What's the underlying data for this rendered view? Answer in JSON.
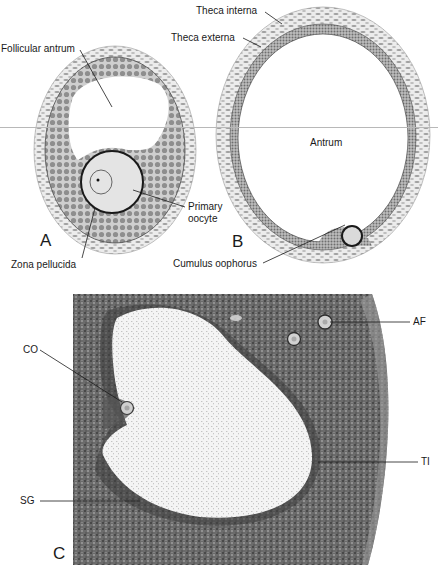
{
  "figure": {
    "panels": [
      {
        "id": "A",
        "letter": "A",
        "type": "illustration",
        "labels": {
          "follicular_antrum": "Follicular antrum",
          "primary_oocyte_line1": "Primary",
          "primary_oocyte_line2": "oocyte",
          "zona_pellucida": "Zona pellucida"
        }
      },
      {
        "id": "B",
        "letter": "B",
        "type": "illustration",
        "labels": {
          "theca_interna": "Theca interna",
          "theca_externa": "Theca externa",
          "antrum": "Antrum",
          "cumulus_oophorus": "Cumulus oophorus"
        }
      },
      {
        "id": "C",
        "letter": "C",
        "type": "photomicrograph",
        "labels": {
          "co": "CO",
          "af": "AF",
          "ti": "TI",
          "sg": "SG"
        }
      }
    ],
    "colors": {
      "cell_fill": "#9a9a9a",
      "cell_layer_bg": "#c9c9c9",
      "theca_bg": "#e6e6e6",
      "oocyte_fill": "#e4e4e4",
      "outline": "#1a1a1a",
      "tissue_dark": "#4a4a4a",
      "tissue_mid": "#7a7a7a",
      "antrum_fluid": "#f2f2f2",
      "separator_line": "#b8b8b8"
    }
  }
}
